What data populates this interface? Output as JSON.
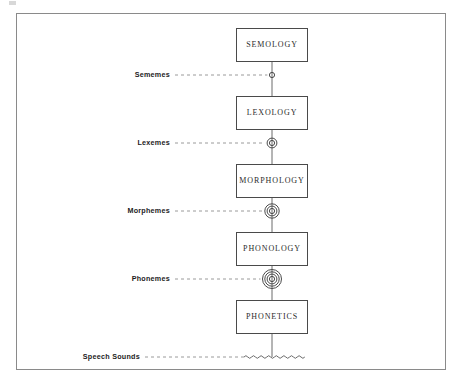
{
  "figure": {
    "type": "stratificational-hierarchy",
    "border_color": "#8a8a8a",
    "box_border_color": "#4a4a4a",
    "line_color": "#6a6a6a",
    "text_color": "#2b2b2b",
    "background": "#ffffff"
  },
  "strata": [
    {
      "label": "SEMOLOGY",
      "x": 236,
      "y": 28,
      "width": 72,
      "height": 34
    },
    {
      "label": "LEXOLOGY",
      "x": 236,
      "y": 96,
      "width": 72,
      "height": 34
    },
    {
      "label": "MORPHOLOGY",
      "x": 236,
      "y": 164,
      "width": 72,
      "height": 34
    },
    {
      "label": "PHONOLOGY",
      "x": 236,
      "y": 232,
      "width": 72,
      "height": 34
    },
    {
      "label": "PHONETICS",
      "x": 236,
      "y": 300,
      "width": 72,
      "height": 34
    }
  ],
  "units": [
    {
      "label": "Sememes",
      "rings": 1,
      "y": 75,
      "node": "single-circle-node"
    },
    {
      "label": "Lexemes",
      "rings": 2,
      "y": 143,
      "node": "double-circle-node"
    },
    {
      "label": "Morphemes",
      "rings": 3,
      "y": 211,
      "node": "triple-circle-node"
    },
    {
      "label": "Phonemes",
      "rings": 4,
      "y": 279,
      "node": "quadruple-circle-node"
    },
    {
      "label": "Speech Sounds",
      "rings": 0,
      "y": 357,
      "node": "wave-node"
    }
  ],
  "axis": {
    "center_x": 272,
    "top": 62,
    "bottom": 357
  }
}
